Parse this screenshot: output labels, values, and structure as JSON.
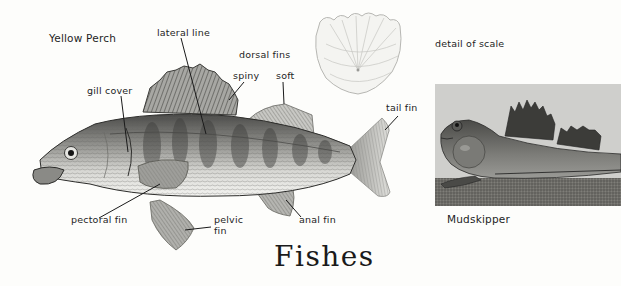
{
  "page": {
    "title": "Fishes"
  },
  "main_figure": {
    "caption": "Yellow Perch",
    "labels": {
      "lateral_line": "lateral line",
      "dorsal_fins": "dorsal fins",
      "spiny": "spiny",
      "soft": "soft",
      "gill_cover": "gill cover",
      "tail_fin": "tail fin",
      "pectoral_fin": "pectoral fin",
      "pelvic_fin_line1": "pelvic",
      "pelvic_fin_line2": "fin",
      "anal_fin": "anal fin"
    }
  },
  "scale_figure": {
    "caption": "detail of scale"
  },
  "inset_figure": {
    "caption": "Mudskipper"
  },
  "colors": {
    "background": "#fdfdfb",
    "ink": "#1a1a1a",
    "panel_bg": "#cfcfcc",
    "mud": "#6e6d68"
  }
}
